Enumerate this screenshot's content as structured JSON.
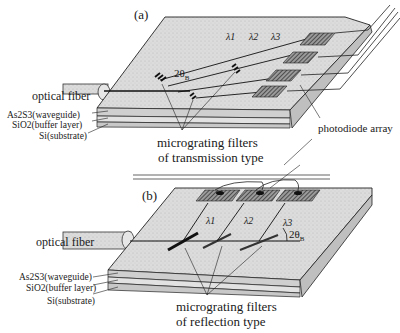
{
  "figure": {
    "panel_a": {
      "label": "(a)",
      "optical_fiber_label": "optical fiber",
      "layers": [
        "As2S3(waveguide)",
        "SiO2(buffer layer)",
        "Si(substrate)"
      ],
      "wavelengths": [
        "λ1",
        "λ2",
        "λ3"
      ],
      "bragg_angle": "2θ",
      "bragg_sub": "B",
      "filters_label_line1": "micrograting filters",
      "filters_label_line2": "of transmission type",
      "photodiode_label": "photodiode array"
    },
    "panel_b": {
      "label": "(b)",
      "optical_fiber_label": "optical fiber",
      "layers": [
        "As2S3(waveguide)",
        "SiO2(buffer layer)",
        "Si(substrate)"
      ],
      "wavelengths": [
        "λ1",
        "λ2",
        "λ3"
      ],
      "bragg_angle": "2θ",
      "bragg_sub": "B",
      "filters_label_line1": "micrograting filters",
      "filters_label_line2": "of reflection type"
    }
  },
  "colors": {
    "slab_fill": "#d9d9d9",
    "slab_edge": "#bdbdbd",
    "line": "#1a1a1a",
    "detector": "#6a6a6a"
  }
}
